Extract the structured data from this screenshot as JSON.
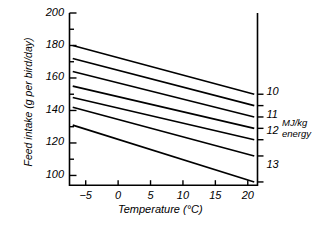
{
  "chart_data": {
    "type": "line",
    "title": "",
    "xlabel": "Temperature (°C)",
    "ylabel": "Feed intake (g per bird/day)",
    "xlim": [
      -7.5,
      21.5
    ],
    "ylim": [
      94,
      200
    ],
    "xticks": [
      -5,
      0,
      5,
      10,
      15,
      20
    ],
    "xtick_labels": [
      "−5",
      "0",
      "5",
      "10",
      "15",
      "20"
    ],
    "yticks": [
      100,
      120,
      140,
      160,
      180,
      200
    ],
    "ytick_labels": [
      "100",
      "120",
      "140",
      "160",
      "180",
      "200"
    ],
    "y_minor_ticks": [
      110,
      130,
      150,
      170,
      190
    ],
    "grid": false,
    "legend_position": "right-axis",
    "right_axis": {
      "title_line1": "MJ/kg",
      "title_line2": "energy",
      "labels": [
        "10",
        "11",
        "12",
        "13"
      ],
      "label_values": [
        151,
        137,
        127,
        106
      ]
    },
    "series": [
      {
        "name": "9.5",
        "x": [
          -7,
          21
        ],
        "values": [
          180,
          150
        ]
      },
      {
        "name": "10",
        "x": [
          -7,
          21
        ],
        "values": [
          172,
          143
        ]
      },
      {
        "name": "10.5",
        "x": [
          -7,
          21
        ],
        "values": [
          164,
          136
        ]
      },
      {
        "name": "11",
        "x": [
          -7,
          21
        ],
        "values": [
          155,
          129
        ]
      },
      {
        "name": "11.5",
        "x": [
          -7,
          21
        ],
        "values": [
          148,
          122
        ]
      },
      {
        "name": "12",
        "x": [
          -7,
          21
        ],
        "values": [
          142,
          112
        ]
      },
      {
        "name": "13",
        "x": [
          -7,
          21
        ],
        "values": [
          131,
          96
        ]
      }
    ]
  },
  "axes": {
    "y_labels": [
      "200",
      "180",
      "160",
      "140",
      "120",
      "100"
    ],
    "x_labels": [
      "−5",
      "0",
      "5",
      "10",
      "15",
      "20"
    ],
    "y_title": "Feed intake (g per bird/day)",
    "x_title": "Temperature (°C)"
  },
  "right_axis": {
    "labels": [
      "10",
      "11",
      "12",
      "13"
    ],
    "title_line1": "MJ/kg",
    "title_line2": "energy"
  }
}
